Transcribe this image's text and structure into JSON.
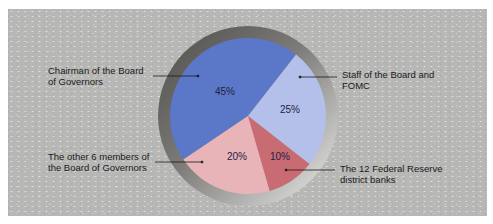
{
  "chart_data": {
    "type": "pie",
    "title": "",
    "categories": [
      "Chairman of the Board of Governors",
      "Staff of the Board and FOMC",
      "The 12 Federal Reserve district banks",
      "The other 6 members of the Board of Governors"
    ],
    "values": [
      45,
      25,
      10,
      20
    ],
    "value_labels": [
      "45%",
      "25%",
      "10%",
      "20%"
    ],
    "colors": [
      "#5b78c8",
      "#b4c0ea",
      "#c96b73",
      "#e8b4b8"
    ],
    "legend_position": "callout labels with leader lines",
    "grid": false
  },
  "labels": {
    "chairman": {
      "line1": "Chairman of the Board",
      "line2": "of Governors"
    },
    "staff": {
      "line1": "Staff of the Board and",
      "line2": "FOMC"
    },
    "other": {
      "line1": "The other 6 members of",
      "line2": "the Board of Governors"
    },
    "fed": {
      "line1": "The 12 Federal Reserve",
      "line2": "district banks"
    }
  },
  "percents": {
    "chairman": "45%",
    "staff": "25%",
    "fed": "10%",
    "other": "20%"
  },
  "colors": {
    "background": "#b7b7b5",
    "ring_dark": "#5e5c58",
    "ring_light": "#e4e4e2"
  }
}
